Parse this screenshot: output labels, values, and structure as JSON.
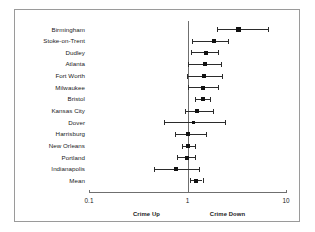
{
  "chart_data": {
    "type": "scatter",
    "subtype": "forest-plot",
    "title": "",
    "xlabel": "",
    "ylabel": "",
    "xscale": "log",
    "xlim": [
      0.1,
      10
    ],
    "xticks": [
      0.1,
      1,
      10
    ],
    "xtick_labels": [
      "0.1",
      "1",
      "10"
    ],
    "reference_line": 1,
    "grid": false,
    "legend": "none",
    "annotations": [
      {
        "text": "Crime Up",
        "side": "left-of-reference"
      },
      {
        "text": "Crime Down",
        "side": "right-of-reference"
      }
    ],
    "categories": [
      "Birmingham",
      "Stoke-on-Trent",
      "Dudley",
      "Atlanta",
      "Fort Worth",
      "Milwaukee",
      "Bristol",
      "Kansas City",
      "Dover",
      "Harrisburg",
      "New Orleans",
      "Portland",
      "Indianapolis",
      "Mean"
    ],
    "points": [
      {
        "label": "Birmingham",
        "estimate": 3.3,
        "ci_low": 2.0,
        "ci_high": 6.6,
        "marker_size": "large"
      },
      {
        "label": "Stoke-on-Trent",
        "estimate": 1.85,
        "ci_low": 1.12,
        "ci_high": 2.6,
        "marker_size": "medium"
      },
      {
        "label": "Dudley",
        "estimate": 1.55,
        "ci_low": 1.08,
        "ci_high": 2.05,
        "marker_size": "medium"
      },
      {
        "label": "Atlanta",
        "estimate": 1.5,
        "ci_low": 1.0,
        "ci_high": 2.2,
        "marker_size": "medium"
      },
      {
        "label": "Fort Worth",
        "estimate": 1.48,
        "ci_low": 0.98,
        "ci_high": 2.25,
        "marker_size": "medium"
      },
      {
        "label": "Milwaukee",
        "estimate": 1.45,
        "ci_low": 1.0,
        "ci_high": 2.05,
        "marker_size": "medium"
      },
      {
        "label": "Bristol",
        "estimate": 1.42,
        "ci_low": 1.2,
        "ci_high": 1.7,
        "marker_size": "medium"
      },
      {
        "label": "Kansas City",
        "estimate": 1.25,
        "ci_low": 0.95,
        "ci_high": 1.8,
        "marker_size": "medium"
      },
      {
        "label": "Dover",
        "estimate": 1.15,
        "ci_low": 0.58,
        "ci_high": 2.4,
        "marker_size": "small"
      },
      {
        "label": "Harrisburg",
        "estimate": 1.02,
        "ci_low": 0.75,
        "ci_high": 1.55,
        "marker_size": "medium"
      },
      {
        "label": "New Orleans",
        "estimate": 1.0,
        "ci_low": 0.88,
        "ci_high": 1.18,
        "marker_size": "medium"
      },
      {
        "label": "Portland",
        "estimate": 0.98,
        "ci_low": 0.78,
        "ci_high": 1.2,
        "marker_size": "medium"
      },
      {
        "label": "Indianapolis",
        "estimate": 0.76,
        "ci_low": 0.46,
        "ci_high": 1.3,
        "marker_size": "medium"
      },
      {
        "label": "Mean",
        "estimate": 1.22,
        "ci_low": 1.05,
        "ci_high": 1.42,
        "marker_size": "medium"
      }
    ]
  }
}
